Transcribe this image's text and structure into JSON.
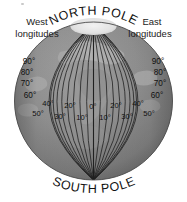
{
  "figure": {
    "type": "globe-longitude-diagram",
    "title_top": "NORTH POLE",
    "title_bottom": "SOUTH POLE",
    "west_label_line1": "West",
    "west_label_line2": "longitudes",
    "east_label_line1": "East",
    "east_label_line2": "longitudes",
    "background_color": "#ffffff",
    "globe_ocean_color": "#8e8e8e",
    "globe_land_color": "#a8a8a8",
    "globe_shadow_color": "#6d6d6d",
    "meridian_color": "#1a1a1a",
    "polar_cap_color": "#e8e8e8",
    "text_color": "#111111"
  },
  "chart_data": {
    "type": "diagram",
    "projection": "orthographic",
    "center_meridian_deg": 0,
    "meridian_spacing_deg": 10,
    "west_longitudes_deg": [
      10,
      20,
      30,
      40,
      50,
      60,
      70,
      80,
      90
    ],
    "east_longitudes_deg": [
      10,
      20,
      30,
      40,
      50,
      60,
      70,
      80,
      90
    ],
    "annotations": [
      "NORTH POLE",
      "SOUTH POLE",
      "West longitudes",
      "East longitudes"
    ]
  },
  "labels": {
    "west_vertical": [
      {
        "text": "90°",
        "x": 29,
        "y": 62
      },
      {
        "text": "80°",
        "x": 27,
        "y": 73
      },
      {
        "text": "70°",
        "x": 27,
        "y": 84
      },
      {
        "text": "60°",
        "x": 30,
        "y": 96
      }
    ],
    "east_vertical": [
      {
        "text": "90°",
        "x": 158,
        "y": 62
      },
      {
        "text": "80°",
        "x": 160,
        "y": 73
      },
      {
        "text": "70°",
        "x": 160,
        "y": 84
      },
      {
        "text": "60°",
        "x": 157,
        "y": 96
      }
    ],
    "upper_row": [
      {
        "text": "40°",
        "x": 48,
        "y": 104
      },
      {
        "text": "20°",
        "x": 70,
        "y": 106
      },
      {
        "text": "0°",
        "x": 93,
        "y": 107
      },
      {
        "text": "20°",
        "x": 116,
        "y": 106
      },
      {
        "text": "40°",
        "x": 138,
        "y": 104
      }
    ],
    "lower_row": [
      {
        "text": "50°",
        "x": 38,
        "y": 114
      },
      {
        "text": "30°",
        "x": 60,
        "y": 117
      },
      {
        "text": "10°",
        "x": 82,
        "y": 118
      },
      {
        "text": "10°",
        "x": 105,
        "y": 118
      },
      {
        "text": "30°",
        "x": 127,
        "y": 117
      },
      {
        "text": "50°",
        "x": 149,
        "y": 114
      }
    ]
  }
}
